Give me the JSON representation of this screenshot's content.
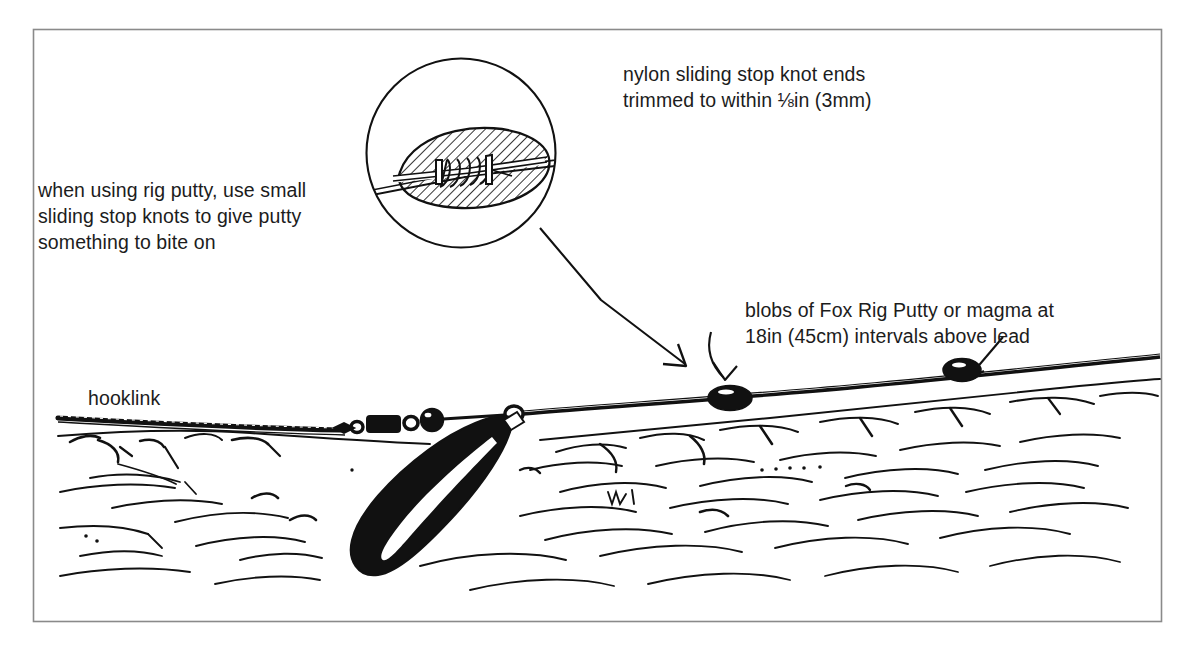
{
  "figure": {
    "border_color": "#8a8a8a",
    "ink_color": "#111111",
    "paper_color": "#ffffff",
    "text_color": "#1c1c1c"
  },
  "annotations": {
    "nylon_knot_ends": "nylon sliding stop knot ends\ntrimmed to within ⅛in (3mm)",
    "rig_putty_tip": "when using rig putty, use small\nsliding stop knots to give putty\nsomething to bite on",
    "putty_blobs": "blobs of Fox Rig Putty or magma at\n18in (45cm) intervals above lead",
    "hooklink": "hooklink"
  },
  "callout": {
    "shape": "circle",
    "center_x": 461,
    "center_y": 153,
    "radius": 95,
    "contents": "hatched putty blob moulded around a coiled sliding stop knot on the line",
    "leader_arrow_to_x": 688,
    "leader_arrow_to_y": 368
  },
  "scene": {
    "mainline_label": "mainline",
    "lakebed_label": "silty lakebed",
    "putty_blobs": [
      {
        "name": "putty-blob-left",
        "x": 730,
        "y": 398,
        "rx": 21,
        "ry": 12
      },
      {
        "name": "putty-blob-right",
        "x": 962,
        "y": 370,
        "rx": 18,
        "ry": 11
      }
    ],
    "blob_arrows": [
      {
        "name": "blob-arrow-left",
        "from_x": 716,
        "from_y": 334,
        "to_x": 728,
        "to_y": 380
      },
      {
        "name": "blob-arrow-right",
        "from_x": 1000,
        "from_y": 340,
        "to_x": 968,
        "to_y": 378
      }
    ],
    "terminal_tackle": [
      {
        "name": "swivel",
        "x": 347,
        "y": 427
      },
      {
        "name": "rig-tube-sleeve",
        "x": 383,
        "y": 425
      },
      {
        "name": "small-bead",
        "x": 411,
        "y": 424
      },
      {
        "name": "large-bead",
        "x": 430,
        "y": 422
      },
      {
        "name": "lead-clip-ring",
        "x": 513,
        "y": 417
      }
    ],
    "lead": {
      "name": "pear-lead-weight",
      "tip_x": 513,
      "tip_y": 420,
      "bottom_x": 404,
      "bottom_y": 580
    }
  }
}
